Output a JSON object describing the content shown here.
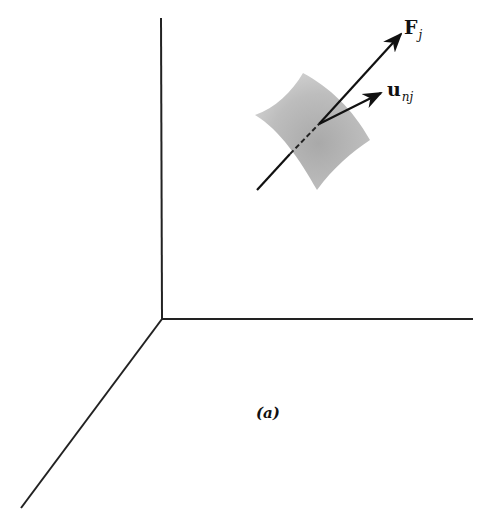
{
  "figure": {
    "caption": "(a)",
    "axes": {
      "origin": [
        162,
        319
      ],
      "z_end": [
        161,
        18
      ],
      "y_end": [
        473,
        319
      ],
      "x_end": [
        21,
        508
      ]
    },
    "surface_patch": {
      "description": "curved surface element (shaded)",
      "color": "#b0b0b0"
    },
    "vectors": [
      {
        "id": "F",
        "symbol": "F",
        "subscript": "j",
        "label": "F_j",
        "from": [
          257,
          190
        ],
        "to": [
          402,
          33
        ]
      },
      {
        "id": "u",
        "symbol": "u",
        "subscript": "n_j",
        "label": "u_{n_j}",
        "from": [
          319,
          124
        ],
        "to": [
          382,
          93
        ]
      }
    ]
  },
  "labels": {
    "F_main": "F",
    "F_sub": "j",
    "u_main": "u",
    "u_sub": "nj",
    "caption": "(a)"
  }
}
